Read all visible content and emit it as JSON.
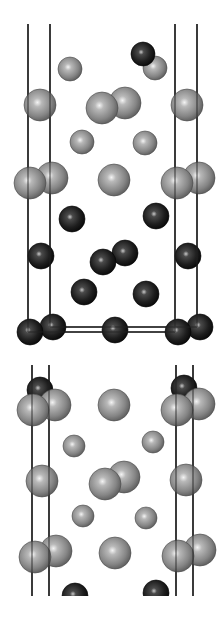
{
  "figure": {
    "colors": {
      "background": "#ffffff",
      "cell_edge": "#222222",
      "light_atom": "#8a8a8a",
      "light_atom_highlight": "#f2f2f2",
      "dark_atom": "#1c1c1c",
      "dark_atom_highlight": "#bdbdbd"
    },
    "panels": [
      {
        "name": "upper-view",
        "cell_lines": [
          {
            "x1": 28,
            "y1": 24,
            "x2": 28,
            "y2": 332
          },
          {
            "x1": 50,
            "y1": 24,
            "x2": 50,
            "y2": 327
          },
          {
            "x1": 175,
            "y1": 24,
            "x2": 175,
            "y2": 332
          },
          {
            "x1": 197,
            "y1": 24,
            "x2": 197,
            "y2": 327
          },
          {
            "x1": 28,
            "y1": 332,
            "x2": 175,
            "y2": 332
          },
          {
            "x1": 50,
            "y1": 327,
            "x2": 197,
            "y2": 327
          }
        ],
        "atoms": [
          {
            "type": "light",
            "x": 155,
            "y": 68,
            "r": 12
          },
          {
            "type": "dark",
            "x": 143,
            "y": 54,
            "r": 12
          },
          {
            "type": "light",
            "x": 70,
            "y": 69,
            "r": 12
          },
          {
            "type": "light",
            "x": 125,
            "y": 103,
            "r": 16
          },
          {
            "type": "light",
            "x": 102,
            "y": 108,
            "r": 16
          },
          {
            "type": "light",
            "x": 40,
            "y": 105,
            "r": 16
          },
          {
            "type": "light",
            "x": 187,
            "y": 105,
            "r": 16
          },
          {
            "type": "light",
            "x": 82,
            "y": 142,
            "r": 12
          },
          {
            "type": "light",
            "x": 145,
            "y": 143,
            "r": 12
          },
          {
            "type": "light",
            "x": 52,
            "y": 178,
            "r": 16
          },
          {
            "type": "light",
            "x": 199,
            "y": 178,
            "r": 16
          },
          {
            "type": "light",
            "x": 30,
            "y": 183,
            "r": 16
          },
          {
            "type": "light",
            "x": 114,
            "y": 180,
            "r": 16
          },
          {
            "type": "light",
            "x": 177,
            "y": 183,
            "r": 16
          },
          {
            "type": "dark",
            "x": 72,
            "y": 219,
            "r": 13
          },
          {
            "type": "dark",
            "x": 156,
            "y": 216,
            "r": 13
          },
          {
            "type": "dark",
            "x": 125,
            "y": 253,
            "r": 13
          },
          {
            "type": "dark",
            "x": 41,
            "y": 256,
            "r": 13
          },
          {
            "type": "dark",
            "x": 103,
            "y": 262,
            "r": 13
          },
          {
            "type": "dark",
            "x": 188,
            "y": 256,
            "r": 13
          },
          {
            "type": "dark",
            "x": 84,
            "y": 292,
            "r": 13
          },
          {
            "type": "dark",
            "x": 146,
            "y": 294,
            "r": 13
          },
          {
            "type": "dark",
            "x": 53,
            "y": 327,
            "r": 13
          },
          {
            "type": "dark",
            "x": 200,
            "y": 327,
            "r": 13
          },
          {
            "type": "dark",
            "x": 30,
            "y": 332,
            "r": 13
          },
          {
            "type": "dark",
            "x": 115,
            "y": 330,
            "r": 13
          },
          {
            "type": "dark",
            "x": 178,
            "y": 332,
            "r": 13
          }
        ]
      },
      {
        "name": "lower-view",
        "cell_lines": [
          {
            "x1": 32,
            "y1": 365,
            "x2": 32,
            "y2": 596
          },
          {
            "x1": 49,
            "y1": 365,
            "x2": 49,
            "y2": 596
          },
          {
            "x1": 176,
            "y1": 365,
            "x2": 176,
            "y2": 596
          },
          {
            "x1": 193,
            "y1": 365,
            "x2": 193,
            "y2": 596
          }
        ],
        "atoms": [
          {
            "type": "dark",
            "x": 40,
            "y": 390,
            "r": 13
          },
          {
            "type": "dark",
            "x": 184,
            "y": 388,
            "r": 13
          },
          {
            "type": "light",
            "x": 55,
            "y": 405,
            "r": 16
          },
          {
            "type": "light",
            "x": 199,
            "y": 404,
            "r": 16
          },
          {
            "type": "light",
            "x": 33,
            "y": 410,
            "r": 16
          },
          {
            "type": "light",
            "x": 114,
            "y": 405,
            "r": 16
          },
          {
            "type": "light",
            "x": 177,
            "y": 410,
            "r": 16
          },
          {
            "type": "light",
            "x": 74,
            "y": 446,
            "r": 11
          },
          {
            "type": "light",
            "x": 153,
            "y": 442,
            "r": 11
          },
          {
            "type": "light",
            "x": 124,
            "y": 477,
            "r": 16
          },
          {
            "type": "light",
            "x": 42,
            "y": 481,
            "r": 16
          },
          {
            "type": "light",
            "x": 105,
            "y": 484,
            "r": 16
          },
          {
            "type": "light",
            "x": 186,
            "y": 480,
            "r": 16
          },
          {
            "type": "light",
            "x": 83,
            "y": 516,
            "r": 11
          },
          {
            "type": "light",
            "x": 146,
            "y": 518,
            "r": 11
          },
          {
            "type": "light",
            "x": 56,
            "y": 551,
            "r": 16
          },
          {
            "type": "light",
            "x": 200,
            "y": 550,
            "r": 16
          },
          {
            "type": "light",
            "x": 35,
            "y": 557,
            "r": 16
          },
          {
            "type": "light",
            "x": 115,
            "y": 553,
            "r": 16
          },
          {
            "type": "light",
            "x": 178,
            "y": 556,
            "r": 16
          },
          {
            "type": "dark",
            "x": 75,
            "y": 596,
            "r": 13,
            "clip_bottom": 596
          },
          {
            "type": "dark",
            "x": 156,
            "y": 593,
            "r": 13,
            "clip_bottom": 596
          }
        ]
      }
    ]
  }
}
